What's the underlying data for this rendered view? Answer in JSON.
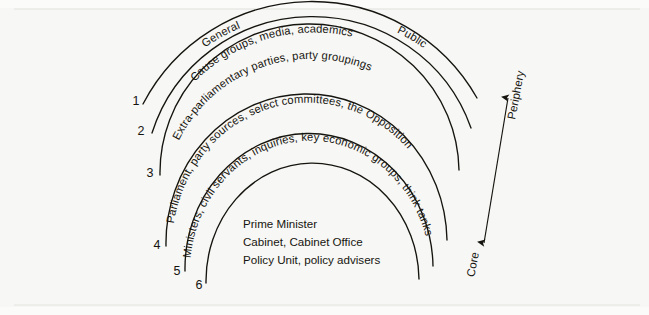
{
  "figure": {
    "type": "concentric-arc-diagram",
    "background_color": "#f7f7f5",
    "ink_color": "#15140f",
    "arc_labels": {
      "arc1_left": "General",
      "arc1_right": "Public",
      "arc2": "Cause groups, media, academics",
      "arc3": "Extra-parliamentary parties, party groupings",
      "arc4": "Parliament, party sources, select committees, the Opposition",
      "arc5": "Ministers, civil servants, inquiries, key economic groups, think tanks"
    },
    "tick_numbers": [
      "1",
      "2",
      "3",
      "4",
      "5",
      "6"
    ],
    "axis": {
      "top_label": "Periphery",
      "bottom_label": "Core"
    },
    "center_block": [
      "Prime Minister",
      "Cabinet, Cabinet Office",
      "Policy Unit, policy advisers"
    ]
  }
}
